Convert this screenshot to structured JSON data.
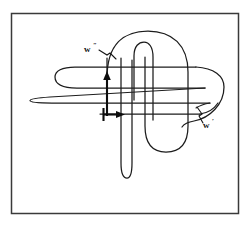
{
  "figure": {
    "background_color": "#ffffff",
    "ink_color": "#1c1c1c",
    "frame": {
      "name": "outer-border",
      "x": 11,
      "y": 13,
      "width": 228,
      "height": 201,
      "stroke_color": "#3a3a3a",
      "stroke_width": 1.5
    },
    "labels": [
      {
        "id": "w-double-prime",
        "base": "w",
        "prime": "″",
        "full_text": "w″",
        "x": 85,
        "y": 51,
        "leader_to_x": 112,
        "leader_to_y": 58
      },
      {
        "id": "w-prime",
        "base": "w",
        "prime": "′",
        "full_text": "w′",
        "x": 205,
        "y": 126,
        "leader_to_x": 200,
        "leader_to_y": 112
      }
    ],
    "arrows": [
      {
        "id": "vertical-orientation-arrow",
        "direction": "up",
        "from_x": 107,
        "from_y": 115,
        "to_x": 107,
        "to_y": 74,
        "color": "#0d0d0d"
      },
      {
        "id": "horizontal-orientation-arrow",
        "direction": "right",
        "from_x": 103,
        "from_y": 114,
        "to_x": 123,
        "to_y": 114,
        "color": "#0d0d0d"
      }
    ],
    "strand_count": 4,
    "crossing_count": 16
  }
}
